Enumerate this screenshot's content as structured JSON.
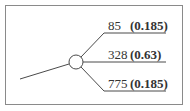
{
  "diagram": {
    "type": "chance-node-tree",
    "node": {
      "shape": "circle",
      "cx": 76,
      "cy": 62,
      "r": 7
    },
    "branches": [
      {
        "value": "85",
        "probability": "(0.185)",
        "y": 33
      },
      {
        "value": "328",
        "probability": "(0.63)",
        "y": 62
      },
      {
        "value": "775",
        "probability": "(0.185)",
        "y": 91
      }
    ],
    "colors": {
      "line": "#4a4a4a",
      "border": "#8a8a8a",
      "text": "#333333"
    }
  }
}
